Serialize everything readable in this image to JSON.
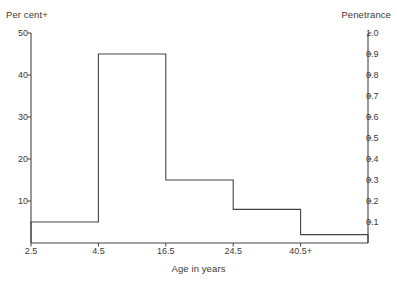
{
  "chart_data": {
    "type": "bar",
    "title": "",
    "xlabel": "Age in years",
    "ylabel": "Per cent+",
    "y2label": "Penetrance",
    "categories": [
      "2.5",
      "4.5",
      "16.5",
      "24.5",
      "40.5+"
    ],
    "values": [
      5,
      45,
      15,
      8,
      2
    ],
    "series": [
      {
        "name": "Per cent+",
        "values": [
          5,
          45,
          15,
          8,
          2
        ]
      },
      {
        "name": "Penetrance",
        "values": [
          0.1,
          0.9,
          0.3,
          0.16,
          0.04
        ]
      }
    ],
    "ylim": [
      0,
      50
    ],
    "y2lim": [
      0,
      1.0
    ],
    "yticks": [
      "10",
      "20",
      "30",
      "40",
      "50"
    ],
    "ytick_values": [
      10,
      20,
      30,
      40,
      50
    ],
    "y2ticks": [
      "0.1",
      "0.2",
      "0.3",
      "0.4",
      "0.5",
      "0.6",
      "0.7",
      "0.8",
      "0.9",
      "1.0"
    ],
    "y2tick_values": [
      0.1,
      0.2,
      0.3,
      0.4,
      0.5,
      0.6,
      0.7,
      0.8,
      0.9,
      1.0
    ],
    "xticks": [
      "2.5",
      "4.5",
      "16.5",
      "24.5",
      "40.5+"
    ],
    "grid": false,
    "legend": "none",
    "style": "step-histogram",
    "line_color": "#444444",
    "text_color": "#3b3b3b",
    "background": "#ffffff"
  },
  "axes": {
    "left_title": "Per cent+",
    "right_title": "Penetrance",
    "bottom_title": "Age in years"
  }
}
